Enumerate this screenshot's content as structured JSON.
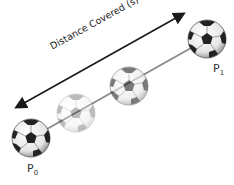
{
  "diagram": {
    "arrow_label": "Distance Covered (s)",
    "start_label": {
      "base": "P",
      "sub": "0"
    },
    "end_label": {
      "base": "P",
      "sub": "1"
    },
    "balls": [
      {
        "name": "start",
        "cx": 31,
        "cy": 138,
        "opacity": 1.0
      },
      {
        "name": "ghost-light",
        "cx": 76,
        "cy": 113,
        "opacity": 0.3
      },
      {
        "name": "ghost-medium",
        "cx": 129,
        "cy": 86,
        "opacity": 0.6
      },
      {
        "name": "end",
        "cx": 207,
        "cy": 39,
        "opacity": 1.0
      }
    ],
    "colors": {
      "path_line": "#8a8a8a",
      "arrow": "#1a1a1a"
    }
  }
}
